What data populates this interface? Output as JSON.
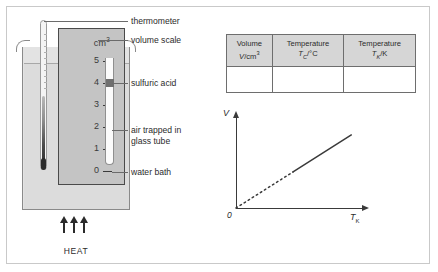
{
  "diagram": {
    "apparatus": {
      "scale_unit": "cm",
      "scale_unit_exponent": "3",
      "scale_numbers": [
        "5",
        "4",
        "3",
        "2",
        "1",
        "0"
      ],
      "heat_label": "HEAT",
      "callouts": [
        {
          "id": "thermometer",
          "label": "thermometer"
        },
        {
          "id": "volume-scale",
          "label": "volume scale"
        },
        {
          "id": "sulfuric-acid",
          "label": "sulfuric acid"
        },
        {
          "id": "air-trapped",
          "label": "air trapped in\nglass tube"
        },
        {
          "id": "water-bath",
          "label": "water bath"
        }
      ]
    },
    "table": {
      "columns": [
        {
          "line1": "Volume",
          "symbol": "V",
          "subscript": "",
          "unit": "cm3"
        },
        {
          "line1": "Temperature",
          "symbol": "T",
          "subscript": "C",
          "unit": "°C"
        },
        {
          "line1": "Temperature",
          "symbol": "T",
          "subscript": "K",
          "unit": "K"
        }
      ],
      "rows": [
        [
          "",
          "",
          ""
        ]
      ]
    },
    "graph": {
      "y_axis_label": "V",
      "x_axis_label": "T",
      "x_axis_subscript": "K",
      "origin_label": "0"
    }
  },
  "chart_data": {
    "type": "line",
    "title": "",
    "xlabel": "T_K",
    "ylabel": "V",
    "xlim": [
      0,
      1
    ],
    "ylim": [
      0,
      1
    ],
    "grid": false,
    "legend": "none",
    "annotations": [
      "0"
    ],
    "series": [
      {
        "name": "extrapolated",
        "style": "dotted",
        "x": [
          0.0,
          0.46
        ],
        "y": [
          0.0,
          0.41
        ]
      },
      {
        "name": "measured",
        "style": "solid",
        "x": [
          0.46,
          0.93
        ],
        "y": [
          0.41,
          0.83
        ]
      }
    ]
  }
}
